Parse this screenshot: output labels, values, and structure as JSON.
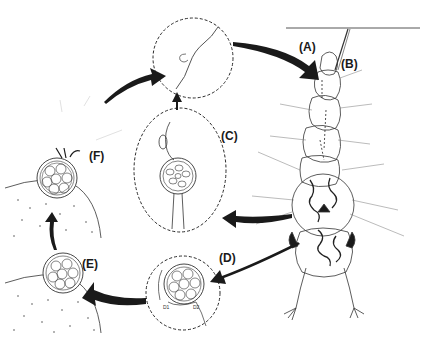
{
  "diagram": {
    "type": "life-cycle",
    "colors": {
      "ink": "#1a1a1a",
      "line": "#333333",
      "dashed": "#2a2a2a",
      "stipple": "#555555",
      "background": "#ffffff"
    },
    "labels": {
      "A": "(A)",
      "B": "(B)",
      "C": "(C)",
      "D": "(D)",
      "E": "(E)",
      "F": "(F)",
      "D1": "D1",
      "D2": "D2"
    },
    "stages": [
      {
        "id": "A",
        "depiction": "insect larva attached to water surface line"
      },
      {
        "id": "B",
        "depiction": "larval respiratory siphon"
      },
      {
        "id": "C",
        "depiction": "magnified sporangium with spores inside dashed circle"
      },
      {
        "id": "D",
        "depiction": "magnified cyst with sub-parts D1 and D2 inside dashed circle"
      },
      {
        "id": "E",
        "depiction": "released cyst resting on substrate"
      },
      {
        "id": "F",
        "depiction": "cyst germinating, releasing zoospores on substrate"
      },
      {
        "id": "top",
        "depiction": "magnified zoospore attaching, inside dashed circle"
      }
    ],
    "arrows": [
      {
        "from": "larva",
        "to": "C"
      },
      {
        "from": "larva",
        "to": "D"
      },
      {
        "from": "D",
        "to": "E"
      },
      {
        "from": "E",
        "to": "F"
      },
      {
        "from": "F",
        "to": "top"
      },
      {
        "from": "C",
        "to": "top"
      },
      {
        "from": "top",
        "to": "A"
      }
    ]
  }
}
